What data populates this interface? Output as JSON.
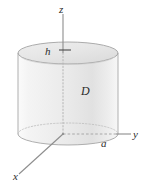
{
  "figure": {
    "background_color": "#ffffff",
    "labels": {
      "z_axis": "z",
      "y_axis": "y",
      "x_axis": "x",
      "height": "h",
      "radius": "a",
      "region": "D"
    },
    "colors": {
      "outline": "#9a9a9a",
      "hidden_line": "#b0b0b0",
      "axis": "#8a8a8a",
      "label": "#2b2b2b",
      "top_face_light": "#f0f0f0",
      "top_face_dark": "#dcdcdc",
      "body_light": "#f6f6f6",
      "body_mid": "#e9e9e9",
      "body_dark": "#dddddd"
    },
    "geometry": {
      "axis_origin_x": 63,
      "axis_origin_y": 134,
      "cylinder_center_x": 68,
      "cylinder_radius_x": 50,
      "cylinder_radius_y": 11,
      "top_ellipse_center_y": 53,
      "bottom_ellipse_center_y": 134,
      "z_axis_top_y": 14,
      "y_axis_end_x": 131,
      "x_axis_end_x": 19,
      "x_axis_end_y": 174
    }
  }
}
